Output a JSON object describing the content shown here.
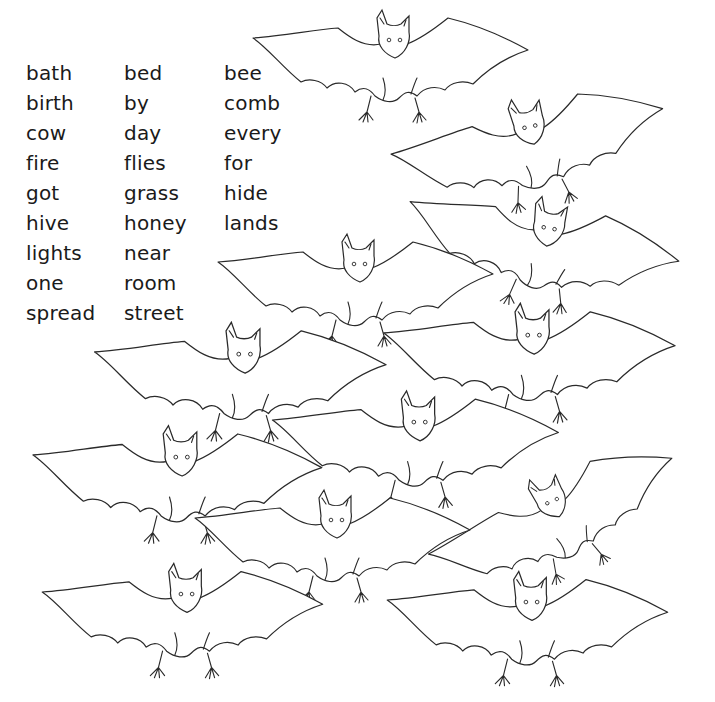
{
  "worksheet": {
    "word_columns": [
      [
        "bath",
        "birth",
        "cow",
        "fire",
        "got",
        "hive",
        "lights",
        "one",
        "spread"
      ],
      [
        "bed",
        "by",
        "day",
        "flies",
        "grass",
        "honey",
        "near",
        "room",
        "street"
      ],
      [
        "bee",
        "comb",
        "every",
        "for",
        "hide",
        "lands"
      ]
    ],
    "illustration": {
      "subject": "bat",
      "count": 12,
      "style": "black line art on white",
      "bats": [
        {
          "x": 393,
          "y": 38,
          "scale": 1.0,
          "rotate": 0
        },
        {
          "x": 528,
          "y": 125,
          "scale": 1.0,
          "rotate": -12
        },
        {
          "x": 548,
          "y": 226,
          "scale": 1.0,
          "rotate": 10
        },
        {
          "x": 358,
          "y": 262,
          "scale": 1.0,
          "rotate": 0
        },
        {
          "x": 532,
          "y": 333,
          "scale": 1.06,
          "rotate": 0
        },
        {
          "x": 243,
          "y": 352,
          "scale": 1.06,
          "rotate": 0
        },
        {
          "x": 418,
          "y": 420,
          "scale": 1.04,
          "rotate": 0
        },
        {
          "x": 180,
          "y": 455,
          "scale": 1.05,
          "rotate": 0
        },
        {
          "x": 550,
          "y": 500,
          "scale": 0.95,
          "rotate": -24
        },
        {
          "x": 335,
          "y": 518,
          "scale": 1.0,
          "rotate": 0
        },
        {
          "x": 185,
          "y": 592,
          "scale": 1.02,
          "rotate": 0
        },
        {
          "x": 530,
          "y": 600,
          "scale": 1.02,
          "rotate": 0
        }
      ]
    },
    "colors": {
      "ink": "#2a2a2a",
      "paper": "#ffffff",
      "text": "#1a1a1a"
    }
  }
}
